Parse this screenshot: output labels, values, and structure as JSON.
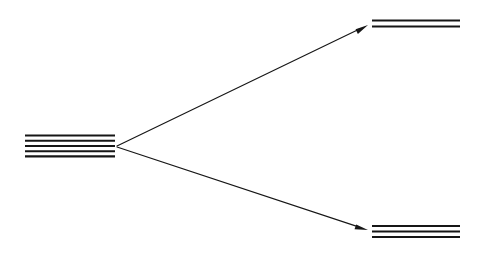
{
  "figure": {
    "background_color": "#ffffff",
    "line_color": "#161616",
    "width": 488,
    "height": 256
  },
  "chart_data": {
    "type": "diagram",
    "subtype": "energy-level-splitting",
    "background": "#ffffff",
    "stroke_color": "#161616",
    "groups": [
      {
        "id": "degenerate-set",
        "name": "degenerate-level-group",
        "position": "left",
        "line_count": 5,
        "x_start": 25,
        "x_end": 115,
        "y_values": [
          135.5,
          140.8,
          146.0,
          151.2,
          156.4
        ],
        "center_x": 115,
        "center_y": 146
      },
      {
        "id": "upper-set",
        "name": "upper-level-group",
        "position": "top-right",
        "line_count": 2,
        "x_start": 372,
        "x_end": 460,
        "y_values": [
          20.5,
          26.5
        ],
        "center_x": 372,
        "center_y": 23.5
      },
      {
        "id": "lower-set",
        "name": "lower-level-group",
        "position": "bottom-right",
        "line_count": 3,
        "x_start": 372,
        "x_end": 460,
        "y_values": [
          226.0,
          231.5,
          237.0
        ],
        "center_x": 372,
        "center_y": 231.5
      }
    ],
    "arrows": [
      {
        "id": "arrow-to-upper",
        "name": "arrow-to-upper-level",
        "from_x": 117,
        "from_y": 146,
        "to_x": 368,
        "to_y": 25,
        "head": "triangle",
        "direction": "up-right"
      },
      {
        "id": "arrow-to-lower",
        "name": "arrow-to-lower-level",
        "from_x": 117,
        "from_y": 147,
        "to_x": 368,
        "to_y": 230,
        "head": "triangle",
        "direction": "down-right"
      }
    ]
  }
}
